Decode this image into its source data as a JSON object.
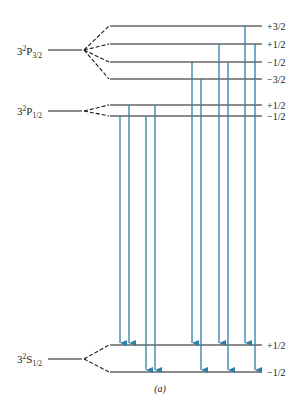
{
  "diagram": {
    "caption": "(a)",
    "colors": {
      "level": "#1a1a1a",
      "arrow": "#2e7fa8"
    },
    "terms": [
      {
        "id": "p32",
        "prefix": "3",
        "sup": "2",
        "letter": "P",
        "sub": "3/2",
        "y": 50,
        "sublevels": [
          {
            "m": "+3/2",
            "y": 26
          },
          {
            "m": "+1/2",
            "y": 44
          },
          {
            "m": "−1/2",
            "y": 62
          },
          {
            "m": "−3/2",
            "y": 79
          }
        ]
      },
      {
        "id": "p12",
        "prefix": "3",
        "sup": "2",
        "letter": "P",
        "sub": "1/2",
        "y": 111,
        "sublevels": [
          {
            "m": "+1/2",
            "y": 105
          },
          {
            "m": "−1/2",
            "y": 116
          }
        ]
      },
      {
        "id": "s12",
        "prefix": "3",
        "sup": "2",
        "letter": "S",
        "sub": "1/2",
        "y": 359,
        "sublevels": [
          {
            "m": "+1/2",
            "y": 345
          },
          {
            "m": "−1/2",
            "y": 372
          }
        ]
      }
    ],
    "transitions": [
      {
        "x": 120,
        "from": "P1/2 −1/2",
        "to": "S1/2 +1/2"
      },
      {
        "x": 129,
        "from": "P1/2 +1/2",
        "to": "S1/2 +1/2"
      },
      {
        "x": 146,
        "from": "P1/2 −1/2",
        "to": "S1/2 −1/2"
      },
      {
        "x": 155,
        "from": "P1/2 +1/2",
        "to": "S1/2 −1/2"
      },
      {
        "x": 192,
        "from": "P3/2 −1/2",
        "to": "S1/2 +1/2"
      },
      {
        "x": 201,
        "from": "P3/2 −3/2",
        "to": "S1/2 −1/2"
      },
      {
        "x": 219,
        "from": "P3/2 +1/2",
        "to": "S1/2 +1/2"
      },
      {
        "x": 228,
        "from": "P3/2 −1/2",
        "to": "S1/2 −1/2"
      },
      {
        "x": 245,
        "from": "P3/2 +3/2",
        "to": "S1/2 +1/2"
      },
      {
        "x": 255,
        "from": "P3/2 +1/2",
        "to": "S1/2 −1/2"
      }
    ]
  }
}
